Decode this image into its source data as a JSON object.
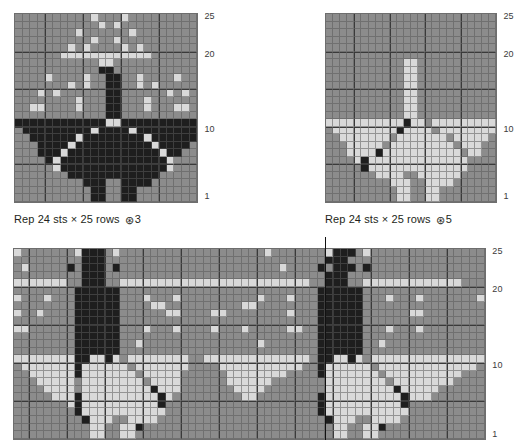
{
  "palette": {
    "background_grey": "#8c8c8c",
    "light_motif": "#d9d9d9",
    "dark_motif": "#1e1e1e",
    "grid_line": "#5a5a5a",
    "heavy_line": "#3a3a3a",
    "page": "#ffffff",
    "text": "#231f20"
  },
  "legend_key": {
    "b": "background-grey",
    "l": "light",
    "d": "dark"
  },
  "charts": [
    {
      "id": "chart-1",
      "name": "butterfly-chart-light-ground",
      "stitches": 24,
      "rows": 25,
      "row_labels": [
        "25",
        "20",
        "10",
        "1"
      ],
      "row_label_rows": [
        25,
        20,
        10,
        1
      ],
      "caption": "Rep 24 sts × 25 rows",
      "caption_symbol": "⊛",
      "caption_number": "3",
      "grid": [
        "bbbbbbbbbblbbblbbbbbbbbb",
        "bbbbbbbbbbblblbbbbbbbbbb",
        "bbbbbbbblbbbbbblbbbbbbbb",
        "bbbbbbbbbblbblbbbbbbbbbb",
        "bbbbbbblblbbbblblbbbbbbb",
        "bbbbbbllllllllllllbbbbbb",
        "bbbbbbbbbbbllbbbbbbbbbbb",
        "bbbbbbbbbbbddbbbbbbbbbbb",
        "bbbblbbbblbbddbblbbbblbb",
        "bbbbbbblblbbddbblblbbbbb",
        "bbblblbbbbbbddbbbbbblblb",
        "bbbbbbbblbbbddbbblbbbbbb",
        "bbllbbbblbbbddbbblbbbllb",
        "bbbbbbbbbbbbddbbbbbbbbbb",
        "ddddddddddddllddddddddddd",
        "bdddddddddlddddlddddddddb",
        "bbddddddlddddddddlddddddb",
        "bbbddddlddddddddddlddddbb",
        "bbbdddlddddddddddddlddbbb",
        "bbbbdlddddddddddddddlbbbb",
        "bbbbblddddddddddddddlbbbb",
        "bbbbbbbddddddddddddbbbbbb",
        "bbbbbbbbbdddbbddddbbbbbbb",
        "bbbbbbbbbbddbbddbbbbbbbbb",
        "bbbbbbbbbbddbbddbbbbbbbbb"
      ]
    },
    {
      "id": "chart-2",
      "name": "butterfly-chart-dark-ground",
      "stitches": 24,
      "rows": 25,
      "row_labels": [
        "25",
        "20",
        "10",
        "1"
      ],
      "row_label_rows": [
        25,
        20,
        10,
        1
      ],
      "caption": "Rep 24 sts × 25 rows",
      "caption_symbol": "⊛",
      "caption_number": "5",
      "grid": [
        "bbbbbbbbbbbbbbbbbbbbbbbb",
        "bbbbbbbbbbbbbbbbbbbbbbbb",
        "bbbbbbbbbbbbbbbbbbbbbbbb",
        "bbbbbbbbbbbbbbbbbbbbbbbb",
        "bbbbbbbbbbbbbbbbbbbbbbbb",
        "bbbbbbbbbbbbbbbbbbbbbbbb",
        "bbbbbbbbbbbllbbbbbbbbbbb",
        "bbbbbbbbbbbllbbbbbbbbbbb",
        "bbbbbbbbbbbllbbbbbbbbbbb",
        "bbbbbbbbbbbllbbbbbbbbbbb",
        "bbbbbbbbbbbllbbbbbbbbbbb",
        "bbbbbbbbbbbllbbbbbbbbbbb",
        "bbbbbbbbbbbllbbbbbbbbbbb",
        "bbbbbbbbbbbllbbbbbbbbbbb",
        "llllllllllldllbllllllllll",
        "bllllllllldllllbllllllllb",
        "bblllllllblllllllblllllbb",
        "bbblllllblllllllllblllbbb",
        "bbblllldlllllllllllbllbbb",
        "bbbbldllllllllllllllbbbbb",
        "bbbbbdllllllllllllllbbbbb",
        "bbbbbbbllllbbllllllbbbbbb",
        "bbbbbbbbblllbbllllbbbbbbb",
        "bbbbbbbbbbllbbllbbbbbbbbb",
        "bbbbbbbbbbllbbllbbbbbbbbb"
      ]
    },
    {
      "id": "chart-3",
      "name": "allover-repeat-chart",
      "stitches": 62,
      "rows": 25,
      "row_labels": [
        "25",
        "20",
        "10",
        "1"
      ],
      "row_label_rows": [
        25,
        20,
        10,
        1
      ],
      "repeat_marker_column": 41,
      "grid": [
        "lbbbbbbbldddblbbbbbbbbbbbbbbbbbbblbbbbbbbldddblbbbbbbbbbbbbbbb",
        "bbbbbbbbbdddbbbbbbbbbbbbbbbbbbbbbbbbbbbbbdddbbbbbbbbbbbbbbbbbb",
        "blbbbbbdbdddbdbbbbbbbbbbbbbbbbbbbbblbbbbdbdddbdbbbbbbbbbbbbbbb",
        "bbbbbbbbbdddbbbbbbbbbbbbbbbbbbbbbbbbbbbbbdddbbbbbbbbbbbbbbbbbb",
        "lllllllbbdddbblllllllllllllllllllllllllbbdddbblllllllllllllbbb",
        "bbbbbbbbddddddbbbbbbbbbbbbbbbbbbbbbbbbbbddddddbbbbbbbbbbbbbbbb",
        "lbbblbbbddddddbbblbbblbbbbbbbbbblbbblbbbddddddbbblbbblbbbbbbbl",
        "bbbbbbbbddddddbbbbllbbbbbbbbbbllbbbbbbbbddddddbbbbbbbbbbbbbbbb",
        "lbblbbbbddddddbbbbbbllbbbbllbbbbbbbblbbbddddddbbbbbbllbbbbbbbb",
        "bbbbbbbbddddddbbbbbbbbbbbbbbbbbbbbbbbbbbddddddbbbbbbbbbbbbbbbb",
        "llbbbbbbddddddbbblbbblbbbblbbblbbbbbllbbddddddbbblbbblbbbbbbbb",
        "bbbbbbbbddddddbbbbbbbbbbbbbbbbbbbbbbbbbbddddddbbbbbbbbbbbbbbbb",
        "bbbbbbbbddddddbblbbbbbbbbbbbbbbblbbbbbbbddddddbblbbbbbbbbbbbbb",
        "bbbbbbbbddddddbbbbbbbbbbbbbbbbbbbbbbbbbbddddddbbbbbbbbbbbbbbbb",
        "llllllllddlldlbllllllllbbllllllllllllllbddlldlblllllllllllllll",
        "bllllllldllllllblllllllbbbblllllllllllbbdllllllblllllllllllllb",
        "bblllllldlllllllblllllbbbbbbllllllllbbbbdlllllllbllllllllllbbb",
        "bbblllllbllllllllbllllbbbbbbllllllbbbbbbbllllllllbllllllllbbbb",
        "bbbbllllbllllllllldlllbbbbbbbllllbbbbbbbbllllllllldlllllbbbbbb",
        "bbbbbllldlllllllllldlbbbbbbbbbllbbbbbbbbdlllllllllldlllbbbbbbb",
        "bbbbbbbldlllllllllldbbbbbbbbbbbbbbbbbbbbdlllllllllldbbbbbbbbbb",
        "bbbbbbbbdlllllllllllbbbbbbbbbbbbbbbbbbbbdlllllllllllbbbbbbbbbb",
        "bbbbbbbbbdlllbbllllbbbbbbbbbbbbbbbbbbbbbbdlllbbllllbbbbbbbbbbb",
        "bbbbbbbbbbllbblldbbbbbbbbbbbbbbbbbbbbbbbbbllbblldbbbbbbbbbbbbb",
        "bbbbbbbbbbllbbllbbbbbbbbbbbbbbbbbbbbbbbbbbllbbllbbbbbbbbbbbbbb"
      ]
    }
  ]
}
